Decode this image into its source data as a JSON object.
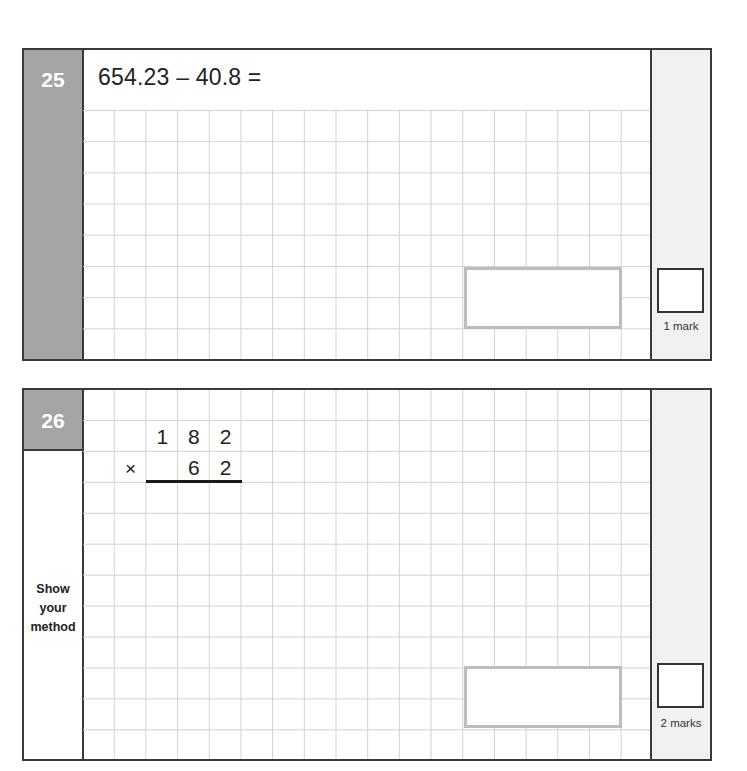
{
  "questions": [
    {
      "number": "25",
      "prompt": "654.23 – 40.8 =",
      "answer_value": "",
      "marks_label": "1 mark",
      "mark_box_value": ""
    },
    {
      "number": "26",
      "side_instruction": [
        "Show",
        "your",
        "method"
      ],
      "multiplication": {
        "operator": "×",
        "top_row": [
          "1",
          "8",
          "2"
        ],
        "bottom_row": [
          "",
          "6",
          "2"
        ]
      },
      "answer_value": "",
      "marks_label": "2 marks",
      "mark_box_value": ""
    }
  ],
  "colors": {
    "number_column": "#a5a5a5",
    "margin_column": "#f1f1f1",
    "grid_line": "#d2d2d2",
    "answer_box_border": "#bdbdbd",
    "frame_border": "#3a3a3a"
  }
}
